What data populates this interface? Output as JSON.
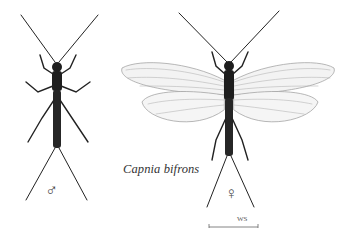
{
  "figure": {
    "species_name": "Capnia bifrons",
    "male_symbol": "♂",
    "female_symbol": "♀",
    "scale_bar_label": "WS"
  },
  "colors": {
    "background": "#ffffff",
    "body": "#1e1e1e",
    "wing_fill": "#f2f2f2",
    "wing_vein": "#9a9a9a"
  }
}
